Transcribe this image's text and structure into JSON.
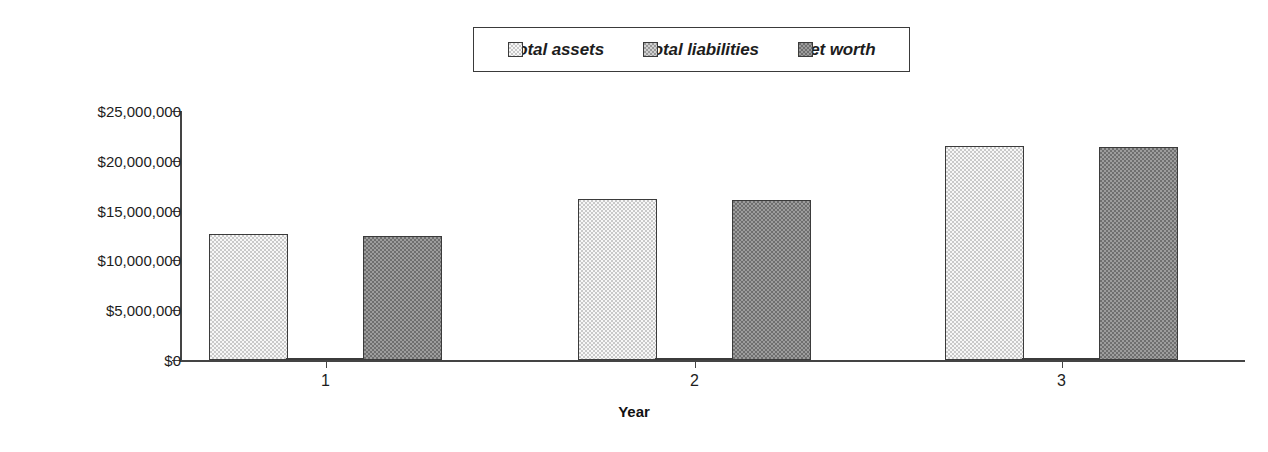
{
  "chart_data": {
    "type": "bar",
    "title": "",
    "xlabel": "Year",
    "ylabel": "",
    "categories": [
      "1",
      "2",
      "3"
    ],
    "ylim": [
      0,
      25000000
    ],
    "yticks": [
      0,
      5000000,
      10000000,
      15000000,
      20000000,
      25000000
    ],
    "ytick_labels": [
      "$0",
      "$5,000,000",
      "$10,000,000",
      "$15,000,000",
      "$20,000,000",
      "$25,000,000"
    ],
    "grid": false,
    "legend_position": "top-center",
    "series": [
      {
        "name": "Total assets",
        "color": "#c9c9c9",
        "values": [
          12650000,
          16200000,
          21500000
        ]
      },
      {
        "name": "Total liabilities",
        "color": "#9a9a9a",
        "values": [
          50000,
          50000,
          50000
        ]
      },
      {
        "name": "Net worth",
        "color": "#6f6f6f",
        "values": [
          12450000,
          16100000,
          21400000
        ]
      }
    ]
  },
  "legend": {
    "entries": [
      {
        "label": "Total assets"
      },
      {
        "label": "Total liabilities"
      },
      {
        "label": "Net worth"
      }
    ]
  },
  "axes": {
    "x_title": "Year",
    "y_tick_labels": [
      "$25,000,000",
      "$20,000,000",
      "$15,000,000",
      "$10,000,000",
      "$5,000,000",
      "$0"
    ],
    "x_tick_labels": [
      "1",
      "2",
      "3"
    ]
  },
  "colors": {
    "axis": "#444444",
    "text": "#1d1d1d",
    "bar_outline": "#3b3b3b",
    "series_total_assets": "#c9c9c9",
    "series_total_liabilities": "#9a9a9a",
    "series_net_worth": "#6f6f6f"
  }
}
